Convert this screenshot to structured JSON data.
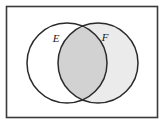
{
  "figure": {
    "name": "venn-diagram-two-sets",
    "width": 165,
    "height": 124,
    "background_color": "#ffffff"
  },
  "universal_set": {
    "shape": "rectangle",
    "label": "",
    "x": 6.5,
    "y": 6.5,
    "width": 151,
    "height": 111,
    "fill": "#ffffff",
    "stroke": "#3a3a3a",
    "stroke_width": 1.6
  },
  "sets": [
    {
      "id": "E",
      "label": "E",
      "cx": 67,
      "cy": 63,
      "r": 40,
      "fill": "#ffffff",
      "stroke": "#2b2b2b",
      "stroke_width": 1.5,
      "label_x": 56,
      "label_y": 39
    },
    {
      "id": "F",
      "label": "F",
      "cx": 98,
      "cy": 63,
      "r": 40,
      "fill": "#ebebeb",
      "stroke": "#2b2b2b",
      "stroke_width": 1.5,
      "label_x": 105,
      "label_y": 38
    }
  ],
  "intersection": {
    "id": "E-and-F",
    "label": "",
    "fill": "#d2d2d2",
    "stroke": "#2b2b2b",
    "stroke_width": 1.5,
    "left_bound": 62,
    "right_bound": 94,
    "top_vertex_x": 82.5,
    "top_vertex_y": 38,
    "bottom_vertex_x": 82.5,
    "bottom_vertex_y": 88
  },
  "chart_data": {
    "type": "diagram",
    "subtype": "venn",
    "title": "",
    "set_count": 2,
    "sets": [
      "E",
      "F"
    ],
    "regions": [
      {
        "name": "E only",
        "shaded": false,
        "fill": "#ffffff"
      },
      {
        "name": "E intersect F",
        "shaded": true,
        "fill": "#d2d2d2"
      },
      {
        "name": "F only",
        "shaded": true,
        "fill": "#ebebeb"
      },
      {
        "name": "outside E and F",
        "shaded": false,
        "fill": "#ffffff"
      }
    ],
    "highlighted_region": "E intersect F"
  }
}
